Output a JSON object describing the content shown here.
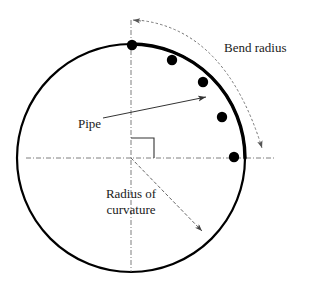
{
  "figure": {
    "labels": {
      "bend_radius": "Bend radius",
      "pipe": "Pipe",
      "radius_of_curvature_line1": "Radius of",
      "radius_of_curvature_line2": "curvature"
    },
    "colors": {
      "stroke": "#000000",
      "text": "#1a1a1a",
      "dashed": "#777777",
      "thin": "#333333",
      "background": "#ffffff"
    },
    "geometry": {
      "circle": {
        "cx": 131,
        "cy": 158,
        "r": 114
      },
      "pipe_arc": {
        "start_angle_deg": 90,
        "end_angle_deg": 0
      },
      "right_angle_marker": {
        "x": 131,
        "y": 138,
        "size": 23
      },
      "bend_radius_arc": {
        "from_x": 133,
        "from_y": 20,
        "to_x": 265,
        "to_y": 157
      },
      "pipe_pointer": {
        "x1": 103,
        "y1": 118,
        "x2": 212,
        "y2": 96
      },
      "radius_pointer": {
        "x1": 131,
        "y1": 158,
        "x2": 207,
        "y2": 236
      }
    },
    "pipe_nodes": [
      {
        "x": 132,
        "y": 45
      },
      {
        "x": 172,
        "y": 60
      },
      {
        "x": 203,
        "y": 82
      },
      {
        "x": 222,
        "y": 117
      },
      {
        "x": 234,
        "y": 157
      }
    ],
    "label_positions": {
      "bend_radius": {
        "x": 224,
        "y": 49
      },
      "pipe": {
        "x": 78,
        "y": 125
      },
      "radius_line1": {
        "x": 131,
        "y": 195
      },
      "radius_line2": {
        "x": 131,
        "y": 211
      }
    }
  }
}
